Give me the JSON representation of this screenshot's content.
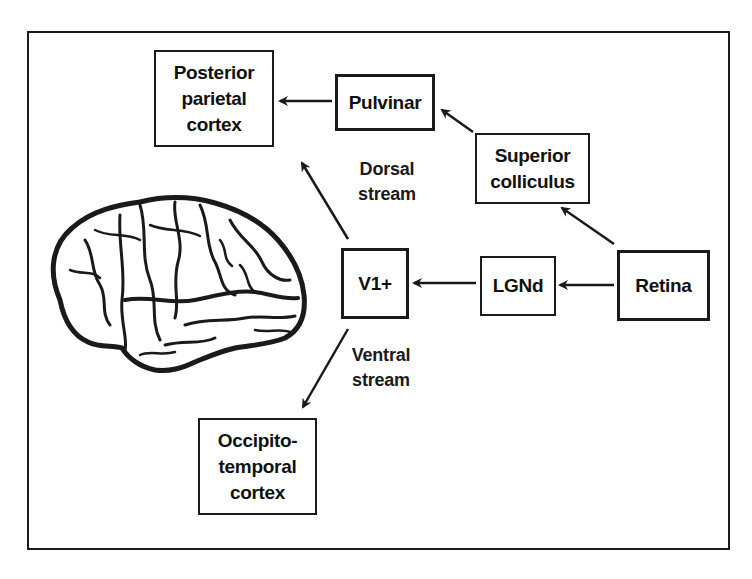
{
  "figure": {
    "title": "",
    "nodes": {
      "posterior_parietal": {
        "lines": [
          "Posterior",
          "parietal",
          "cortex"
        ]
      },
      "pulvinar": {
        "label": "Pulvinar"
      },
      "superior_colliculus": {
        "lines": [
          "Superior",
          "colliculus"
        ]
      },
      "v1": {
        "label": "V1+"
      },
      "lgnd": {
        "label": "LGNd"
      },
      "retina": {
        "label": "Retina"
      },
      "occipito_temporal": {
        "lines": [
          "Occipito-",
          "temporal",
          "cortex"
        ]
      }
    },
    "stream_labels": {
      "dorsal": {
        "lines": [
          "Dorsal",
          "stream"
        ]
      },
      "ventral": {
        "lines": [
          "Ventral",
          "stream"
        ]
      }
    },
    "edges": [
      {
        "from": "Retina",
        "to": "LGNd"
      },
      {
        "from": "LGNd",
        "to": "V1+"
      },
      {
        "from": "Retina",
        "to": "Superior colliculus"
      },
      {
        "from": "Superior colliculus",
        "to": "Pulvinar"
      },
      {
        "from": "Pulvinar",
        "to": "Posterior parietal cortex"
      },
      {
        "from": "V1+",
        "to": "Posterior parietal cortex",
        "label": "Dorsal stream"
      },
      {
        "from": "V1+",
        "to": "Occipito-temporal cortex",
        "label": "Ventral stream"
      }
    ],
    "illustration": "brain-lateral-view",
    "colors": {
      "ink": "#1a1a1a",
      "background": "#ffffff"
    }
  }
}
